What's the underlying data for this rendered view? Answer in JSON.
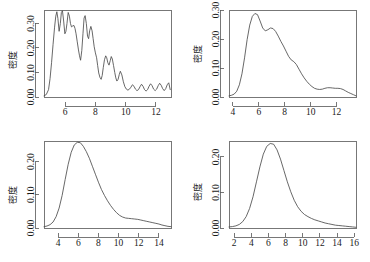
{
  "figure": {
    "layout": "2x2-grid",
    "background": "#ffffff",
    "line_color": "#4d4d4d",
    "axis_color": "#555555",
    "text_color": "#1a1a1a"
  },
  "chart_data": [
    {
      "id": "panel-top-left",
      "type": "line",
      "title": "",
      "xlabel": "",
      "ylabel": "密度",
      "xlim": [
        4.6,
        13.0
      ],
      "ylim": [
        0.0,
        0.355
      ],
      "xticks": [
        6,
        8,
        10,
        12
      ],
      "xtick_labels": [
        "6",
        "8",
        "10",
        "12"
      ],
      "yticks": [
        0.0,
        0.1,
        0.2,
        0.3
      ],
      "ytick_labels": [
        "0.00",
        "0.10",
        "0.20",
        "0.30"
      ],
      "grid": false,
      "legend": "none",
      "description": "kernel density estimate with very small bandwidth, highly oscillatory multimodal curve",
      "x": [
        4.6,
        4.75,
        4.9,
        5.0,
        5.1,
        5.2,
        5.3,
        5.38,
        5.45,
        5.52,
        5.6,
        5.68,
        5.75,
        5.82,
        5.9,
        5.98,
        6.05,
        6.12,
        6.2,
        6.28,
        6.35,
        6.42,
        6.5,
        6.58,
        6.65,
        6.72,
        6.8,
        6.88,
        6.95,
        7.02,
        7.1,
        7.18,
        7.25,
        7.32,
        7.4,
        7.48,
        7.55,
        7.62,
        7.7,
        7.78,
        7.85,
        7.92,
        8.0,
        8.08,
        8.15,
        8.22,
        8.3,
        8.38,
        8.45,
        8.52,
        8.6,
        8.68,
        8.75,
        8.82,
        8.9,
        8.98,
        9.05,
        9.12,
        9.2,
        9.28,
        9.35,
        9.42,
        9.5,
        9.58,
        9.65,
        9.75,
        9.85,
        9.95,
        10.05,
        10.15,
        10.25,
        10.35,
        10.45,
        10.55,
        10.65,
        10.75,
        10.85,
        10.95,
        11.05,
        11.15,
        11.25,
        11.35,
        11.45,
        11.55,
        11.65,
        11.75,
        11.85,
        11.95,
        12.05,
        12.15,
        12.25,
        12.35,
        12.45,
        12.55,
        12.65,
        12.75,
        12.85,
        12.95
      ],
      "y": [
        0.005,
        0.01,
        0.03,
        0.075,
        0.14,
        0.215,
        0.285,
        0.33,
        0.348,
        0.32,
        0.268,
        0.3,
        0.345,
        0.352,
        0.31,
        0.258,
        0.268,
        0.3,
        0.345,
        0.33,
        0.3,
        0.286,
        0.29,
        0.292,
        0.28,
        0.258,
        0.225,
        0.192,
        0.168,
        0.15,
        0.19,
        0.26,
        0.322,
        0.332,
        0.3,
        0.248,
        0.238,
        0.27,
        0.288,
        0.27,
        0.238,
        0.205,
        0.18,
        0.16,
        0.128,
        0.098,
        0.08,
        0.072,
        0.088,
        0.12,
        0.152,
        0.168,
        0.16,
        0.14,
        0.13,
        0.148,
        0.165,
        0.155,
        0.128,
        0.1,
        0.078,
        0.065,
        0.072,
        0.092,
        0.105,
        0.09,
        0.062,
        0.042,
        0.032,
        0.028,
        0.032,
        0.04,
        0.05,
        0.044,
        0.032,
        0.026,
        0.03,
        0.042,
        0.052,
        0.044,
        0.03,
        0.024,
        0.03,
        0.044,
        0.054,
        0.046,
        0.032,
        0.026,
        0.032,
        0.046,
        0.056,
        0.048,
        0.034,
        0.026,
        0.034,
        0.05,
        0.058,
        0.03
      ]
    },
    {
      "id": "panel-top-right",
      "type": "line",
      "title": "",
      "xlabel": "",
      "ylabel": "密度",
      "xlim": [
        3.7,
        13.5
      ],
      "ylim": [
        0.0,
        0.3
      ],
      "xticks": [
        4,
        6,
        8,
        10,
        12
      ],
      "xtick_labels": [
        "4",
        "6",
        "8",
        "10",
        "12"
      ],
      "yticks": [
        0.0,
        0.1,
        0.2,
        0.3
      ],
      "ytick_labels": [
        "0.00",
        "0.10",
        "0.20",
        "0.30"
      ],
      "grid": false,
      "legend": "none",
      "description": "kernel density estimate with moderate bandwidth, bimodal with shoulder near 8.7",
      "x": [
        3.7,
        3.9,
        4.1,
        4.3,
        4.5,
        4.7,
        4.9,
        5.1,
        5.3,
        5.5,
        5.7,
        5.9,
        6.1,
        6.3,
        6.5,
        6.7,
        6.9,
        7.1,
        7.3,
        7.5,
        7.7,
        7.9,
        8.1,
        8.3,
        8.5,
        8.7,
        8.9,
        9.1,
        9.3,
        9.5,
        9.7,
        9.9,
        10.1,
        10.3,
        10.5,
        10.7,
        10.9,
        11.1,
        11.3,
        11.5,
        11.7,
        11.9,
        12.1,
        12.3,
        12.5,
        12.7,
        12.9,
        13.1,
        13.3,
        13.5
      ],
      "y": [
        0.004,
        0.006,
        0.01,
        0.02,
        0.042,
        0.08,
        0.135,
        0.198,
        0.248,
        0.278,
        0.288,
        0.284,
        0.262,
        0.238,
        0.228,
        0.232,
        0.238,
        0.236,
        0.226,
        0.21,
        0.192,
        0.176,
        0.158,
        0.14,
        0.128,
        0.122,
        0.112,
        0.096,
        0.08,
        0.066,
        0.054,
        0.044,
        0.036,
        0.03,
        0.027,
        0.026,
        0.027,
        0.03,
        0.032,
        0.032,
        0.031,
        0.03,
        0.03,
        0.029,
        0.026,
        0.021,
        0.016,
        0.012,
        0.008,
        0.004
      ]
    },
    {
      "id": "panel-bottom-left",
      "type": "line",
      "title": "",
      "xlabel": "",
      "ylabel": "密度",
      "xlim": [
        2.6,
        15.2
      ],
      "ylim": [
        0.0,
        0.262
      ],
      "xticks": [
        4,
        6,
        8,
        10,
        12,
        14
      ],
      "xtick_labels": [
        "4",
        "6",
        "8",
        "10",
        "12",
        "14"
      ],
      "yticks": [
        0.0,
        0.1,
        0.2
      ],
      "ytick_labels": [
        "0.00",
        "0.10",
        "0.20"
      ],
      "grid": false,
      "legend": "none",
      "description": "kernel density estimate with larger bandwidth, right-skewed unimodal peak near 6.2 with shoulder near 11",
      "x": [
        2.6,
        2.9,
        3.2,
        3.5,
        3.8,
        4.1,
        4.4,
        4.7,
        5.0,
        5.3,
        5.6,
        5.9,
        6.2,
        6.5,
        6.8,
        7.1,
        7.4,
        7.7,
        8.0,
        8.3,
        8.6,
        8.9,
        9.2,
        9.5,
        9.8,
        10.1,
        10.4,
        10.7,
        11.0,
        11.3,
        11.6,
        11.9,
        12.2,
        12.5,
        12.8,
        13.1,
        13.4,
        13.7,
        14.0,
        14.3,
        14.6,
        14.9,
        15.2
      ],
      "y": [
        0.004,
        0.006,
        0.01,
        0.018,
        0.034,
        0.06,
        0.098,
        0.146,
        0.192,
        0.228,
        0.25,
        0.258,
        0.257,
        0.246,
        0.23,
        0.21,
        0.186,
        0.162,
        0.138,
        0.116,
        0.098,
        0.082,
        0.068,
        0.056,
        0.046,
        0.038,
        0.033,
        0.03,
        0.029,
        0.028,
        0.027,
        0.026,
        0.024,
        0.022,
        0.02,
        0.018,
        0.016,
        0.014,
        0.012,
        0.009,
        0.007,
        0.005,
        0.004
      ]
    },
    {
      "id": "panel-bottom-right",
      "type": "line",
      "title": "",
      "xlabel": "",
      "ylabel": "密度",
      "xlim": [
        1.4,
        16.2
      ],
      "ylim": [
        0.0,
        0.245
      ],
      "xticks": [
        2,
        4,
        6,
        8,
        10,
        12,
        14,
        16
      ],
      "xtick_labels": [
        "2",
        "4",
        "6",
        "8",
        "10",
        "12",
        "14",
        "16"
      ],
      "yticks": [
        0.0,
        0.1,
        0.2
      ],
      "ytick_labels": [
        "0.00",
        "0.10",
        "0.20"
      ],
      "grid": false,
      "legend": "none",
      "description": "kernel density estimate with largest bandwidth, smooth unimodal peak near 6.5 with long right tail",
      "x": [
        1.4,
        1.8,
        2.2,
        2.6,
        3.0,
        3.4,
        3.8,
        4.2,
        4.6,
        5.0,
        5.4,
        5.8,
        6.2,
        6.6,
        7.0,
        7.4,
        7.8,
        8.2,
        8.6,
        9.0,
        9.4,
        9.8,
        10.2,
        10.6,
        11.0,
        11.4,
        11.8,
        12.2,
        12.6,
        13.0,
        13.4,
        13.8,
        14.2,
        14.6,
        15.0,
        15.4,
        15.8,
        16.2
      ],
      "y": [
        0.003,
        0.004,
        0.006,
        0.01,
        0.018,
        0.032,
        0.055,
        0.088,
        0.13,
        0.172,
        0.208,
        0.23,
        0.238,
        0.236,
        0.22,
        0.194,
        0.162,
        0.13,
        0.102,
        0.078,
        0.06,
        0.047,
        0.038,
        0.032,
        0.027,
        0.023,
        0.02,
        0.017,
        0.014,
        0.012,
        0.01,
        0.008,
        0.007,
        0.006,
        0.005,
        0.004,
        0.003,
        0.002
      ]
    }
  ]
}
